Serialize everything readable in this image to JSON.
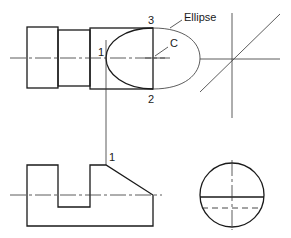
{
  "diagram": {
    "type": "orthographic projection with auxiliary ellipse",
    "labels": {
      "ellipse": "Ellipse",
      "center": "C",
      "point1_top": "1",
      "point2": "2",
      "point3": "3",
      "point1_front": "1"
    },
    "views": [
      {
        "name": "top-view",
        "description": "Stepped cylinder with elliptical cut curve"
      },
      {
        "name": "miter-construction",
        "description": "45° miter line with horizontal and vertical projectors"
      },
      {
        "name": "front-view",
        "description": "Profile with slot and inclined face"
      },
      {
        "name": "side-view",
        "description": "Circular end view with solid and hidden horizontal lines"
      }
    ],
    "colors": {
      "line": "#1a1a1a",
      "background": "#ffffff"
    }
  }
}
